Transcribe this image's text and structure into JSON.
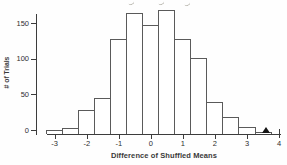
{
  "figure": {
    "kind": "scanned textbook histogram figure"
  },
  "chart_data": {
    "type": "bar",
    "subtype": "histogram",
    "title": "",
    "xlabel": "Difference of Shuffled Means",
    "ylabel": "# of Trials",
    "bin_width": 0.5,
    "bin_centers": [
      -3,
      -2.5,
      -2,
      -1.5,
      -1,
      -0.5,
      0,
      0.5,
      1,
      1.5,
      2,
      2.5,
      3,
      3.5
    ],
    "counts": [
      5,
      8,
      32,
      48,
      128,
      163,
      147,
      167,
      128,
      103,
      43,
      22,
      9,
      2
    ],
    "x_ticks": [
      -3,
      -2,
      -1,
      0,
      1,
      2,
      3,
      4
    ],
    "y_ticks": [
      0,
      50,
      100,
      150
    ],
    "xlim": [
      -3.35,
      4.05
    ],
    "ylim": [
      0,
      175
    ],
    "grid": false,
    "legend": null,
    "bar_fill": "#ffffff",
    "bar_edge_color": "#5a5a5a",
    "axis_color": "#3c3c3c",
    "marker": {
      "shape": "triangle-up-filled",
      "x": 3.6,
      "color": "#141414"
    }
  }
}
